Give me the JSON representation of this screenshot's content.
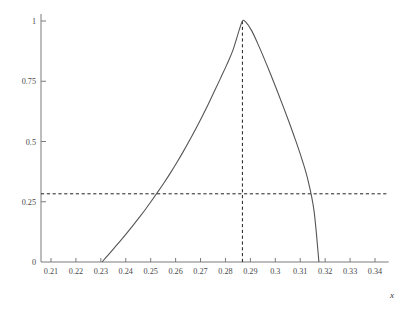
{
  "chart_data": {
    "type": "line",
    "title": "",
    "subtitle": "",
    "xlabel": "x",
    "ylabel": "",
    "xlim": [
      0.2045,
      0.3455
    ],
    "ylim": [
      0,
      1.04
    ],
    "grid": false,
    "legend": null,
    "x_ticks": [
      0.21,
      0.22,
      0.23,
      0.24,
      0.25,
      0.26,
      0.27,
      0.28,
      0.29,
      0.3,
      0.31,
      0.32,
      0.33,
      0.34
    ],
    "x_tick_labels": [
      "0.21",
      "0.22",
      "0.23",
      "0.24",
      "0.25",
      "0.26",
      "0.27",
      "0.28",
      "0.29",
      "0.3",
      "0.31",
      "0.32",
      "0.33",
      "0.34"
    ],
    "y_ticks": [
      0,
      0.25,
      0.5,
      0.75,
      1
    ],
    "y_tick_labels": [
      "0",
      "0.25",
      "0.5",
      "0.75",
      "1"
    ],
    "series": [
      {
        "name": "curve",
        "style": "solid",
        "color": "#555555",
        "x": [
          0.2305,
          0.233,
          0.2355,
          0.238,
          0.2405,
          0.243,
          0.2455,
          0.248,
          0.2505,
          0.253,
          0.2555,
          0.258,
          0.2605,
          0.263,
          0.2655,
          0.268,
          0.2705,
          0.273,
          0.2755,
          0.278,
          0.2805,
          0.283,
          0.2855,
          0.2868,
          0.288,
          0.2905,
          0.293,
          0.2955,
          0.298,
          0.3005,
          0.303,
          0.3055,
          0.308,
          0.3105,
          0.313,
          0.3155,
          0.3175
        ],
        "y": [
          0.0,
          0.03,
          0.06,
          0.09,
          0.121,
          0.153,
          0.186,
          0.22,
          0.256,
          0.293,
          0.331,
          0.371,
          0.413,
          0.457,
          0.503,
          0.551,
          0.601,
          0.653,
          0.707,
          0.762,
          0.818,
          0.879,
          0.962,
          1.0,
          0.997,
          0.96,
          0.905,
          0.845,
          0.782,
          0.717,
          0.65,
          0.581,
          0.509,
          0.432,
          0.344,
          0.215,
          0.0
        ]
      }
    ],
    "annotations": [
      {
        "name": "peak-vertical-dashed-line",
        "type": "vline",
        "x": 0.2868,
        "y_from": 0,
        "y_to": 1.0,
        "style": "dashed"
      },
      {
        "name": "threshold-horizontal-dashed-line",
        "type": "hline",
        "y": 0.283,
        "x_from": 0.2045,
        "x_to": 0.3455,
        "style": "dashed"
      }
    ]
  }
}
